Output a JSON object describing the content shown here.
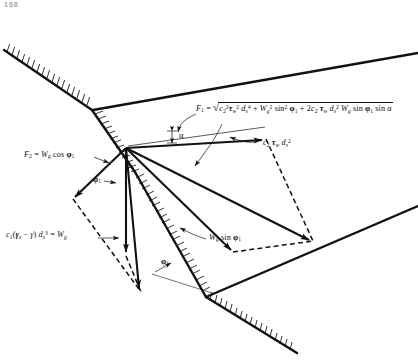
{
  "figure": {
    "page_marker": "168",
    "title_absent": true,
    "background_color": "#ffffff",
    "line_color": "#111111"
  },
  "labels": {
    "f1_formula": {
      "name": "resultant-force-equation",
      "lhs": "F",
      "lhs_sub": "1",
      "eq": "=",
      "terms": [
        "c₂² τw² ds⁴",
        "Wg² sin² ϕ₁",
        "2 c₂ τw ds² Wg sin ϕ₁ sin α"
      ],
      "plain_text": "F1 = sqrt( c2^2 tau_w^2 d_s^4 + W_g^2 sin^2 phi_1 + 2 c2 tau_w d_s^2 W_g sin phi_1 sin alpha )"
    },
    "shear_force": {
      "name": "shear-force-label",
      "plain_text": "c2 tau_w d_s^2"
    },
    "f2_formula": {
      "name": "normal-force-equation",
      "plain_text": "F2 = W_g cos phi_1"
    },
    "weight_formula": {
      "name": "submerged-weight-equation",
      "plain_text": "c1 (gamma_s - gamma) d_s^3 = W_g"
    },
    "wg_sin": {
      "name": "tangential-weight-label",
      "plain_text": "W_g sin phi_1"
    },
    "alpha": {
      "name": "angle-alpha-label",
      "plain_text": "α"
    },
    "phi1_upper": {
      "name": "angle-phi1-upper-label",
      "plain_text": "ϕ₁"
    },
    "phi1_lower": {
      "name": "angle-phi1-lower-label",
      "plain_text": "ϕ₁"
    }
  },
  "geometry": {
    "apex_point": [
      126,
      148
    ],
    "bank_nodes": [
      [
        5,
        52
      ],
      [
        92,
        110
      ],
      [
        126,
        148
      ]
    ],
    "upper_right_bank": [
      [
        126,
        110
      ],
      [
        418,
        55
      ]
    ],
    "lower_right_bank": [
      [
        206,
        297
      ],
      [
        418,
        207
      ]
    ],
    "lower_hatched_bank": [
      [
        206,
        297
      ],
      [
        295,
        352
      ]
    ],
    "vectors": [
      {
        "name": "shear-vector",
        "from": [
          126,
          148
        ],
        "to": [
          265,
          140
        ]
      },
      {
        "name": "resultant-vector",
        "from": [
          126,
          148
        ],
        "to": [
          310,
          240
        ]
      },
      {
        "name": "weight-tangential-vector",
        "from": [
          126,
          148
        ],
        "to": [
          230,
          250
        ]
      },
      {
        "name": "normal-vector",
        "from": [
          126,
          148
        ],
        "to": [
          75,
          198
        ]
      },
      {
        "name": "weight-vector",
        "from": [
          126,
          148
        ],
        "to": [
          126,
          253
        ]
      },
      {
        "name": "weight-resultant-vector",
        "from": [
          126,
          148
        ],
        "to": [
          140,
          290
        ]
      }
    ],
    "dashed_lines": [
      [
        [
          265,
          140
        ],
        [
          310,
          240
        ]
      ],
      [
        [
          230,
          250
        ],
        [
          310,
          240
        ]
      ],
      [
        [
          75,
          198
        ],
        [
          140,
          290
        ]
      ],
      [
        [
          126,
          253
        ],
        [
          140,
          290
        ]
      ]
    ]
  }
}
